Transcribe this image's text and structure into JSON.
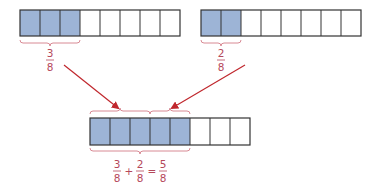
{
  "colors": {
    "shaded": "#9db4d6",
    "stroke": "#333333",
    "label": "#b5485a",
    "arrow": "#c0272d"
  },
  "bars": [
    {
      "name": "bar-three-eighths",
      "total": 8,
      "shaded": 3,
      "x": 20,
      "y": 10
    },
    {
      "name": "bar-two-eighths",
      "total": 8,
      "shaded": 2,
      "x": 201,
      "y": 10
    },
    {
      "name": "bar-five-eighths",
      "total": 8,
      "shaded": 5,
      "x": 90,
      "y": 118
    }
  ],
  "labels": {
    "left": {
      "num": "3",
      "den": "8"
    },
    "right": {
      "num": "2",
      "den": "8"
    },
    "sum": {
      "a_num": "3",
      "a_den": "8",
      "plus": "+",
      "b_num": "2",
      "b_den": "8",
      "eq": "=",
      "c_num": "5",
      "c_den": "8"
    }
  }
}
